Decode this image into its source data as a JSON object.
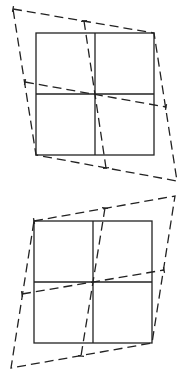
{
  "figures": [
    {
      "name": "top-figure",
      "description": "Square grid (2x2) with dashed sheared parallelogram overlay, shear to the left at top",
      "solid_square": {
        "x1": 36,
        "y1": 33,
        "x2": 154,
        "y2": 155,
        "cx": 95,
        "cy": 94
      },
      "dashed_quad": [
        [
          13,
          9
        ],
        [
          154,
          33
        ],
        [
          177,
          181
        ],
        [
          36,
          155
        ]
      ],
      "dashed_mid_lines": [
        {
          "from": [
            25,
            82
          ],
          "to": [
            166,
            107
          ]
        },
        {
          "from": [
            84,
            21
          ],
          "to": [
            106,
            168
          ]
        }
      ]
    },
    {
      "name": "bottom-figure",
      "description": "Square grid (2x2) with dashed sheared parallelogram overlay, shear to the right at top",
      "solid_square": {
        "x1": 34,
        "y1": 221,
        "x2": 152,
        "y2": 343,
        "cx": 93,
        "cy": 282
      },
      "dashed_quad": [
        [
          34,
          221
        ],
        [
          175,
          196
        ],
        [
          152,
          343
        ],
        [
          11,
          368
        ]
      ],
      "dashed_mid_lines": [
        {
          "from": [
            22,
            294
          ],
          "to": [
            164,
            270
          ]
        },
        {
          "from": [
            105,
            208
          ],
          "to": [
            81,
            356
          ]
        }
      ]
    }
  ],
  "colors": {
    "stroke": "#222222",
    "background": "#ffffff"
  }
}
